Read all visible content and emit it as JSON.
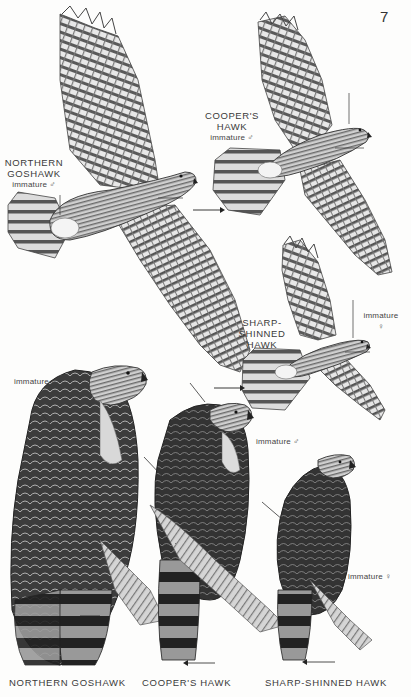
{
  "page": {
    "number": "7",
    "background": "#fdfdfc"
  },
  "flight_figures": [
    {
      "id": "northern-goshawk",
      "name_lines": [
        "NORTHERN",
        "GOSHAWK"
      ],
      "age_sex": "immature ♂"
    },
    {
      "id": "coopers-hawk",
      "name_lines": [
        "COOPER'S",
        "HAWK"
      ],
      "age_sex": "immature ♂"
    },
    {
      "id": "sharp-shinned-hawk",
      "name_lines": [
        "SHARP-",
        "SHINNED",
        "HAWK"
      ],
      "age_sex_lines": [
        "immature",
        "♀"
      ]
    }
  ],
  "perched_figures": [
    {
      "id": "northern-goshawk",
      "age_sex": "immature ♂",
      "caption": "NORTHERN GOSHAWK"
    },
    {
      "id": "coopers-hawk",
      "age_sex": "immature ♂",
      "caption": "COOPER'S HAWK"
    },
    {
      "id": "sharp-shinned-hawk",
      "age_sex": "immature ♀",
      "caption": "SHARP-SHINNED HAWK"
    }
  ],
  "colors": {
    "ink": "#2a2a2a",
    "mid_gray": "#8a8a8a",
    "light_gray": "#d9d9d9",
    "dark_plumage": "#3b3b3b"
  }
}
